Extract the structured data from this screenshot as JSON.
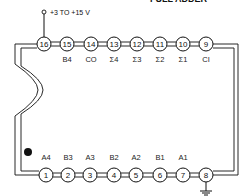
{
  "title": "FULL ADDER",
  "supply_label": "+3 TO +15 V",
  "ground_pin": 8,
  "supply_pin": 16,
  "top_pins": [
    {
      "num": "16",
      "label": "",
      "x": 44
    },
    {
      "num": "15",
      "label": "B4",
      "x": 67
    },
    {
      "num": "14",
      "label": "CO",
      "x": 91
    },
    {
      "num": "13",
      "label": "Σ4",
      "x": 114
    },
    {
      "num": "12",
      "label": "Σ3",
      "x": 137
    },
    {
      "num": "11",
      "label": "Σ2",
      "x": 160
    },
    {
      "num": "10",
      "label": "Σ1",
      "x": 183
    },
    {
      "num": "9",
      "label": "CI",
      "x": 206
    }
  ],
  "bottom_pins": [
    {
      "num": "1",
      "label": "A4",
      "x": 46
    },
    {
      "num": "2",
      "label": "B3",
      "x": 68
    },
    {
      "num": "3",
      "label": "A3",
      "x": 90
    },
    {
      "num": "4",
      "label": "B2",
      "x": 114
    },
    {
      "num": "5",
      "label": "A2",
      "x": 136
    },
    {
      "num": "6",
      "label": "B1",
      "x": 160
    },
    {
      "num": "7",
      "label": "A1",
      "x": 183
    },
    {
      "num": "8",
      "label": "",
      "x": 206
    }
  ],
  "colors": {
    "ink": "#111111",
    "background": "#ffffff"
  }
}
